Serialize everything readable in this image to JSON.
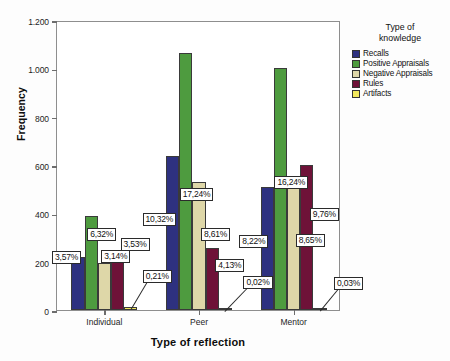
{
  "chart_data": {
    "type": "bar",
    "title": "",
    "xlabel": "Type of reflection",
    "ylabel": "Frequency",
    "ylim": [
      0,
      1200
    ],
    "yticks": [
      "0",
      "200",
      "400",
      "600",
      "800",
      "1.000",
      "1.200"
    ],
    "ytick_values": [
      0,
      200,
      400,
      600,
      800,
      1000,
      1200
    ],
    "grid": false,
    "legend_position": "right",
    "legend_title": "Type of\nknowledge",
    "categories": [
      "Individual",
      "Peer",
      "Mentor"
    ],
    "series": [
      {
        "name": "Recalls",
        "color": "#2e3180",
        "values": [
          220,
          636,
          507
        ],
        "labels": [
          "3,57%",
          "10,32%",
          "8,22%"
        ]
      },
      {
        "name": "Positive Appraisals",
        "color": "#4e9b3f",
        "values": [
          390,
          1063,
          1001
        ],
        "labels": [
          "6,32%",
          "17,24%",
          "16,24%"
        ]
      },
      {
        "name": "Negative Appraisals",
        "color": "#ded7a8",
        "values": [
          195,
          531,
          533
        ],
        "labels": [
          "3,14%",
          "8,61%",
          "8,65%"
        ]
      },
      {
        "name": "Rules",
        "color": "#6e1238",
        "values": [
          218,
          255,
          602
        ],
        "labels": [
          "3,53%",
          "4,13%",
          "9,76%"
        ]
      },
      {
        "name": "Artifacts",
        "color": "#f2e85c",
        "values": [
          13,
          1,
          2
        ],
        "labels": [
          "0,21%",
          "0,02%",
          "0,03%"
        ]
      }
    ]
  }
}
